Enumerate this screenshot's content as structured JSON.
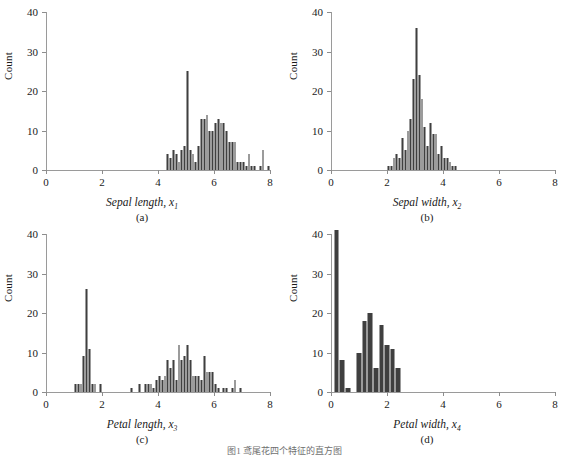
{
  "figure": {
    "caption": "图1 鸢尾花四个特征的直方图",
    "bar_color": "#3f3f3f",
    "axis_color": "#9a9a9a"
  },
  "chart_data": [
    {
      "type": "bar",
      "panel": "a",
      "panel_label": "(a)",
      "title": "",
      "xlabel": "Sepal length, x",
      "xlabel_sub": "1",
      "ylabel": "Count",
      "xlim": [
        0,
        8
      ],
      "ylim": [
        0,
        40
      ],
      "xticks": [
        0,
        2,
        4,
        6,
        8
      ],
      "yticks": [
        0,
        10,
        20,
        30,
        40
      ],
      "grid": false,
      "bin_width": 0.1,
      "bin_starts": [
        4.3,
        4.4,
        4.5,
        4.6,
        4.7,
        4.8,
        4.9,
        5.0,
        5.1,
        5.2,
        5.3,
        5.4,
        5.5,
        5.6,
        5.7,
        5.8,
        5.9,
        6.0,
        6.1,
        6.2,
        6.3,
        6.4,
        6.5,
        6.6,
        6.7,
        6.8,
        6.9,
        7.0,
        7.1,
        7.2,
        7.3,
        7.4,
        7.6,
        7.7,
        7.9
      ],
      "values": [
        4,
        3,
        5,
        4,
        2,
        5,
        6,
        25,
        5,
        4,
        2,
        6,
        13,
        13,
        14,
        10,
        10,
        12,
        13,
        12,
        12,
        10,
        7,
        7,
        7,
        2,
        2,
        2,
        1,
        4,
        1,
        1,
        1,
        5,
        1
      ]
    },
    {
      "type": "bar",
      "panel": "b",
      "panel_label": "(b)",
      "title": "",
      "xlabel": "Sepal width, x",
      "xlabel_sub": "2",
      "ylabel": "Count",
      "xlim": [
        0,
        8
      ],
      "ylim": [
        0,
        40
      ],
      "xticks": [
        0,
        2,
        4,
        6,
        8
      ],
      "yticks": [
        0,
        10,
        20,
        30,
        40
      ],
      "grid": false,
      "bin_width": 0.1,
      "bin_starts": [
        2.0,
        2.1,
        2.2,
        2.3,
        2.4,
        2.5,
        2.6,
        2.7,
        2.8,
        2.9,
        3.0,
        3.1,
        3.2,
        3.3,
        3.4,
        3.5,
        3.6,
        3.7,
        3.8,
        3.9,
        4.0,
        4.1,
        4.2,
        4.3,
        4.4
      ],
      "values": [
        1,
        1,
        3,
        4,
        3,
        8,
        5,
        10,
        13,
        23,
        36,
        24,
        18,
        11,
        6,
        12,
        9,
        9,
        4,
        6,
        3,
        3,
        2,
        1,
        1
      ]
    },
    {
      "type": "bar",
      "panel": "c",
      "panel_label": "(c)",
      "title": "",
      "xlabel": "Petal length, x",
      "xlabel_sub": "3",
      "ylabel": "Count",
      "xlim": [
        0,
        8
      ],
      "ylim": [
        0,
        40
      ],
      "xticks": [
        0,
        2,
        4,
        6,
        8
      ],
      "yticks": [
        0,
        10,
        20,
        30,
        40
      ],
      "grid": false,
      "bin_width": 0.1,
      "bin_starts": [
        1.0,
        1.1,
        1.2,
        1.3,
        1.4,
        1.5,
        1.6,
        1.7,
        1.9,
        3.0,
        3.3,
        3.5,
        3.6,
        3.7,
        3.8,
        3.9,
        4.0,
        4.1,
        4.2,
        4.3,
        4.4,
        4.5,
        4.6,
        4.7,
        4.8,
        4.9,
        5.0,
        5.1,
        5.2,
        5.3,
        5.4,
        5.5,
        5.6,
        5.7,
        5.8,
        5.9,
        6.0,
        6.1,
        6.3,
        6.4,
        6.6,
        6.7,
        6.9
      ],
      "values": [
        2,
        2,
        2,
        9,
        26,
        11,
        2,
        2,
        2,
        1,
        2,
        2,
        2,
        2,
        1,
        3,
        4,
        3,
        4,
        8,
        6,
        8,
        3,
        12,
        8,
        9,
        12,
        8,
        4,
        4,
        4,
        3,
        9,
        5,
        5,
        5,
        2,
        1,
        1,
        1,
        1,
        3,
        1
      ]
    },
    {
      "type": "bar",
      "panel": "d",
      "panel_label": "(d)",
      "title": "",
      "xlabel": "Petal width, x",
      "xlabel_sub": "4",
      "ylabel": "Count",
      "xlim": [
        0,
        8
      ],
      "ylim": [
        0,
        40
      ],
      "xticks": [
        0,
        2,
        4,
        6,
        8
      ],
      "yticks": [
        0,
        10,
        20,
        30,
        40
      ],
      "grid": false,
      "bin_width": 0.2,
      "bin_starts": [
        0.1,
        0.3,
        0.5,
        0.9,
        1.1,
        1.3,
        1.5,
        1.7,
        1.9,
        2.1,
        2.3
      ],
      "values": [
        41,
        8,
        1,
        10,
        18,
        20,
        6,
        17,
        12,
        11,
        6
      ]
    }
  ]
}
